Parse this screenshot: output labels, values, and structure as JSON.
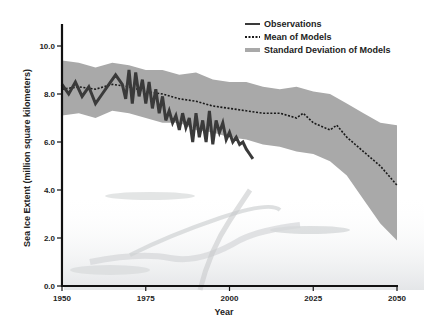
{
  "chart_data": {
    "type": "line",
    "title": "",
    "xlabel": "Year",
    "ylabel": "Sea Ice Extent (million square kilometers)",
    "xlim": [
      1950,
      2050
    ],
    "ylim": [
      0,
      11
    ],
    "x_ticks": [
      "1950",
      "1975",
      "2000",
      "2025",
      "2050"
    ],
    "y_ticks": [
      "0.0",
      "2.0",
      "4.0",
      "6.0",
      "8.0",
      "10.0"
    ],
    "grid": false,
    "legend_position": "top-right",
    "legend": [
      {
        "label": "Observations",
        "style": "solid",
        "color": "#3a3a3a"
      },
      {
        "label": "Mean of Models",
        "style": "dotted",
        "color": "#1a1a1a"
      },
      {
        "label": "Standard Deviation of Models",
        "style": "band",
        "color": "#a8a8a8"
      }
    ],
    "series": [
      {
        "name": "Observations",
        "x": [
          1950,
          1952,
          1954,
          1956,
          1958,
          1960,
          1962,
          1964,
          1966,
          1968,
          1969,
          1970,
          1971,
          1972,
          1973,
          1974,
          1975,
          1976,
          1977,
          1978,
          1979,
          1980,
          1981,
          1982,
          1983,
          1984,
          1985,
          1986,
          1987,
          1988,
          1989,
          1990,
          1991,
          1992,
          1993,
          1994,
          1995,
          1996,
          1997,
          1998,
          1999,
          2000,
          2001,
          2002,
          2003,
          2004,
          2005,
          2006,
          2007
        ],
        "values": [
          8.4,
          8.0,
          8.5,
          7.9,
          8.3,
          7.6,
          8.0,
          8.4,
          8.8,
          8.4,
          7.8,
          9.0,
          7.6,
          8.9,
          7.9,
          8.6,
          7.6,
          8.5,
          7.4,
          8.2,
          7.2,
          7.9,
          6.9,
          7.3,
          6.8,
          7.1,
          6.5,
          7.2,
          6.6,
          7.0,
          6.0,
          7.2,
          6.2,
          6.9,
          6.0,
          7.3,
          5.9,
          6.9,
          6.4,
          6.8,
          6.1,
          6.4,
          6.0,
          6.2,
          5.9,
          6.0,
          5.7,
          5.5,
          5.3
        ]
      },
      {
        "name": "Mean of Models",
        "x": [
          1950,
          1955,
          1960,
          1965,
          1970,
          1975,
          1980,
          1985,
          1990,
          1995,
          2000,
          2005,
          2010,
          2015,
          2020,
          2022,
          2025,
          2030,
          2032,
          2035,
          2040,
          2045,
          2050
        ],
        "values": [
          8.2,
          8.3,
          8.2,
          8.4,
          8.3,
          8.1,
          8.0,
          7.8,
          7.7,
          7.5,
          7.4,
          7.3,
          7.2,
          7.2,
          7.0,
          7.2,
          6.8,
          6.5,
          6.7,
          6.2,
          5.6,
          5.0,
          4.2
        ]
      },
      {
        "name": "Standard Deviation of Models (upper)",
        "x": [
          1950,
          1955,
          1960,
          1965,
          1970,
          1975,
          1980,
          1985,
          1990,
          1995,
          2000,
          2005,
          2010,
          2015,
          2020,
          2025,
          2030,
          2035,
          2040,
          2045,
          2050
        ],
        "values": [
          9.4,
          9.3,
          9.1,
          9.3,
          9.2,
          9.0,
          9.0,
          8.8,
          8.9,
          8.6,
          8.5,
          8.5,
          8.3,
          8.2,
          8.3,
          8.1,
          8.0,
          7.6,
          7.2,
          6.8,
          6.7
        ]
      },
      {
        "name": "Standard Deviation of Models (lower)",
        "x": [
          1950,
          1955,
          1960,
          1965,
          1970,
          1975,
          1980,
          1985,
          1990,
          1995,
          2000,
          2005,
          2010,
          2015,
          2020,
          2025,
          2030,
          2035,
          2040,
          2045,
          2050
        ],
        "values": [
          7.1,
          7.2,
          7.0,
          7.3,
          7.2,
          7.0,
          6.8,
          6.8,
          6.5,
          6.4,
          6.2,
          6.1,
          5.9,
          5.8,
          5.6,
          5.5,
          5.2,
          4.6,
          3.6,
          2.6,
          1.9
        ]
      }
    ]
  }
}
